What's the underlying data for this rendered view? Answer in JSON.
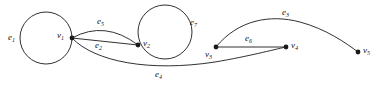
{
  "figure": {
    "type": "multigraph-diagram",
    "background_color": "#ffffff",
    "stroke_color": "#1a1a1a",
    "label_color": "#111111"
  },
  "vertices": [
    {
      "id": "v1",
      "label": "v",
      "sub": "1",
      "x": 72,
      "y": 38,
      "label_x": 57,
      "label_y": 31
    },
    {
      "id": "v2",
      "label": "v",
      "sub": "2",
      "x": 138,
      "y": 45,
      "label_x": 143,
      "label_y": 39
    },
    {
      "id": "v3",
      "label": "v",
      "sub": "3",
      "x": 216,
      "y": 47,
      "label_x": 205,
      "label_y": 50
    },
    {
      "id": "v4",
      "label": "v",
      "sub": "4",
      "x": 286,
      "y": 47,
      "label_x": 291,
      "label_y": 41
    },
    {
      "id": "v5",
      "label": "v",
      "sub": "5",
      "x": 358,
      "y": 52,
      "label_x": 363,
      "label_y": 46
    }
  ],
  "edges": [
    {
      "id": "e1",
      "label": "e",
      "sub": "1",
      "kind": "loop",
      "at": "v1",
      "label_x": 8,
      "label_y": 33
    },
    {
      "id": "e7",
      "label": "e",
      "sub": "7",
      "kind": "loop",
      "at": "v2",
      "label_x": 190,
      "label_y": 18
    },
    {
      "id": "e5",
      "label": "e",
      "sub": "5",
      "kind": "arc",
      "from": "v1",
      "to": "v2",
      "label_x": 97,
      "label_y": 17
    },
    {
      "id": "e2",
      "label": "e",
      "sub": "2",
      "kind": "line",
      "from": "v1",
      "to": "v2",
      "label_x": 95,
      "label_y": 41
    },
    {
      "id": "e4",
      "label": "e",
      "sub": "4",
      "kind": "arc",
      "from": "v1",
      "to": "v4",
      "label_x": 155,
      "label_y": 70
    },
    {
      "id": "e6",
      "label": "e",
      "sub": "6",
      "kind": "line",
      "from": "v3",
      "to": "v4",
      "label_x": 245,
      "label_y": 34
    },
    {
      "id": "e3",
      "label": "e",
      "sub": "3",
      "kind": "arc",
      "from": "v3",
      "to": "v5",
      "label_x": 282,
      "label_y": 8
    }
  ]
}
